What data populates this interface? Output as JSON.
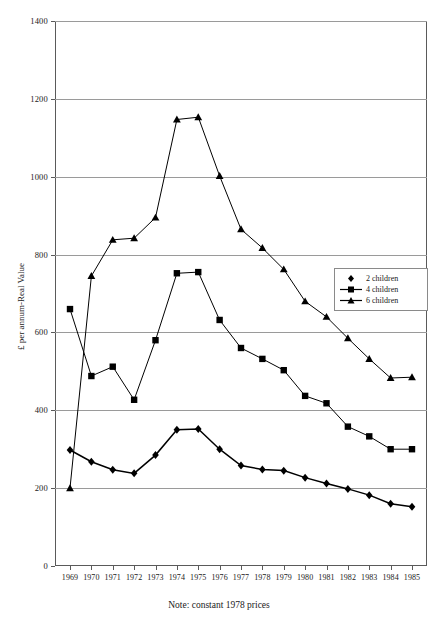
{
  "chart_data": {
    "type": "line",
    "title": "",
    "xlabel": "",
    "ylabel": "£ per annum-Real Value",
    "note": "Note: constant 1978 prices",
    "x": [
      1969,
      1970,
      1971,
      1972,
      1973,
      1974,
      1975,
      1976,
      1977,
      1978,
      1979,
      1980,
      1981,
      1982,
      1983,
      1984,
      1985
    ],
    "categories": [
      "1969",
      "1970",
      "1971",
      "1972",
      "1973",
      "1974",
      "1975",
      "1976",
      "1977",
      "1978",
      "1979",
      "1980",
      "1981",
      "1982",
      "1983",
      "1984",
      "1985"
    ],
    "ylim": [
      0,
      1400
    ],
    "yticks": [
      0,
      200,
      400,
      600,
      800,
      1000,
      1200,
      1400
    ],
    "ytick_labels": [
      "0",
      "200",
      "400",
      "600",
      "800",
      "1000",
      "1200",
      "1400"
    ],
    "grid": true,
    "legend_position": "right-middle",
    "series": [
      {
        "name": "2 children",
        "marker": "diamond",
        "color": "#000000",
        "values": [
          298,
          268,
          247,
          238,
          285,
          350,
          352,
          300,
          258,
          248,
          245,
          227,
          212,
          198,
          182,
          160,
          152
        ]
      },
      {
        "name": "4 children",
        "marker": "square",
        "color": "#000000",
        "values": [
          660,
          488,
          512,
          427,
          580,
          752,
          755,
          632,
          560,
          532,
          503,
          437,
          418,
          358,
          333,
          300,
          300
        ]
      },
      {
        "name": "6 children",
        "marker": "triangle",
        "color": "#000000",
        "values": [
          200,
          745,
          838,
          842,
          895,
          1147,
          1153,
          1002,
          865,
          817,
          762,
          680,
          640,
          585,
          532,
          483,
          485
        ]
      }
    ]
  },
  "legend": {
    "items": [
      {
        "label": "2 children"
      },
      {
        "label": "4 children"
      },
      {
        "label": "6 children"
      }
    ]
  }
}
